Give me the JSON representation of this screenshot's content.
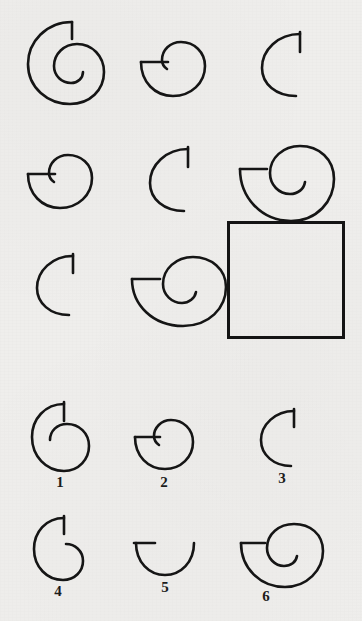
{
  "page": {
    "kind": "progressive-matrices-item",
    "background_color": "#efeeec",
    "ink_color": "#151515",
    "width": 362,
    "height": 621
  },
  "matrix": {
    "name": "spiral-matrix",
    "rows": 3,
    "columns": 3,
    "cells": [
      {
        "id": "cell-r1c1",
        "row": 1,
        "col": 1,
        "shape": "spiral",
        "turns": 2.0,
        "tick": "vertical-top",
        "size": "large",
        "x": 22,
        "y": 14,
        "w": 95,
        "h": 95
      },
      {
        "id": "cell-r1c2",
        "row": 1,
        "col": 2,
        "shape": "spiral",
        "turns": 1.25,
        "tick": "horizontal-left",
        "size": "small",
        "x": 137,
        "y": 38,
        "w": 72,
        "h": 60
      },
      {
        "id": "cell-r1c3",
        "row": 1,
        "col": 3,
        "shape": "arc",
        "turns": 0.75,
        "tick": "vertical-top",
        "size": "small",
        "x": 256,
        "y": 26,
        "w": 60,
        "h": 72
      },
      {
        "id": "cell-r2c1",
        "row": 2,
        "col": 1,
        "shape": "spiral",
        "turns": 1.25,
        "tick": "horizontal-left",
        "size": "small",
        "x": 24,
        "y": 152,
        "w": 72,
        "h": 58
      },
      {
        "id": "cell-r2c2",
        "row": 2,
        "col": 2,
        "shape": "arc",
        "turns": 0.75,
        "tick": "vertical-top",
        "size": "small",
        "x": 144,
        "y": 141,
        "w": 60,
        "h": 72
      },
      {
        "id": "cell-r2c3",
        "row": 2,
        "col": 3,
        "shape": "spiral",
        "turns": 1.75,
        "tick": "horizontal-left",
        "size": "large",
        "x": 235,
        "y": 143,
        "w": 100,
        "h": 78
      },
      {
        "id": "cell-r3c1",
        "row": 3,
        "col": 1,
        "shape": "arc",
        "turns": 0.75,
        "tick": "vertical-top",
        "size": "small",
        "x": 31,
        "y": 248,
        "w": 56,
        "h": 68
      },
      {
        "id": "cell-r3c2",
        "row": 3,
        "col": 2,
        "shape": "spiral",
        "turns": 1.75,
        "tick": "horizontal-left",
        "size": "large",
        "x": 127,
        "y": 253,
        "w": 100,
        "h": 72
      },
      {
        "id": "cell-r3c3",
        "row": 3,
        "col": 3,
        "shape": "empty-answer-box",
        "turns": null,
        "tick": null,
        "size": "large",
        "x": 227,
        "y": 221,
        "w": 118,
        "h": 118
      }
    ]
  },
  "options": {
    "name": "answer-options",
    "count": 6,
    "items": [
      {
        "id": "option-1",
        "label": "1",
        "shape": "spiral",
        "turns": 1.75,
        "tick": "vertical-top",
        "size": "medium",
        "x": 28,
        "y": 399,
        "w": 62,
        "h": 74,
        "label_x": 14,
        "label_y": 474
      },
      {
        "id": "option-2",
        "label": "2",
        "shape": "spiral",
        "turns": 1.25,
        "tick": "horizontal-left",
        "size": "medium",
        "x": 131,
        "y": 417,
        "w": 63,
        "h": 54,
        "label_x": 124,
        "label_y": 474
      },
      {
        "id": "option-3",
        "label": "3",
        "shape": "arc",
        "turns": 0.75,
        "tick": "vertical-top",
        "size": "small",
        "x": 256,
        "y": 404,
        "w": 50,
        "h": 64,
        "label_x": 244,
        "label_y": 474
      },
      {
        "id": "option-4",
        "label": "4",
        "shape": "spiral",
        "turns": 1.5,
        "tick": "vertical-top",
        "size": "medium",
        "x": 30,
        "y": 513,
        "w": 54,
        "h": 68,
        "label_x": 14,
        "label_y": 586
      },
      {
        "id": "option-5",
        "label": "5",
        "shape": "arc",
        "turns": 0.5,
        "tick": "horizontal-left",
        "size": "medium",
        "x": 131,
        "y": 538,
        "w": 66,
        "h": 38,
        "label_x": 124,
        "label_y": 586
      },
      {
        "id": "option-6",
        "label": "6",
        "shape": "spiral",
        "turns": 1.75,
        "tick": "horizontal-left",
        "size": "large",
        "x": 236,
        "y": 521,
        "w": 88,
        "h": 66,
        "label_x": 236,
        "label_y": 586
      }
    ]
  }
}
